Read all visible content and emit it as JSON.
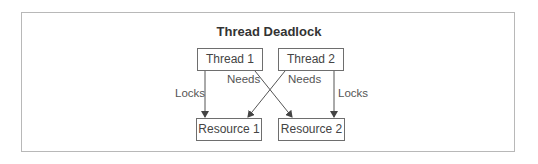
{
  "diagram": {
    "title": "Thread Deadlock",
    "nodes": {
      "thread1": "Thread 1",
      "thread2": "Thread 2",
      "resource1": "Resource 1",
      "resource2": "Resource 2"
    },
    "edges": {
      "t1_r1": "Locks",
      "t1_r2": "Needs",
      "t2_r1": "Needs",
      "t2_r2": "Locks"
    },
    "colors": {
      "line": "#555555",
      "border": "#6e6e6e",
      "frame": "#b8b8b8"
    }
  }
}
